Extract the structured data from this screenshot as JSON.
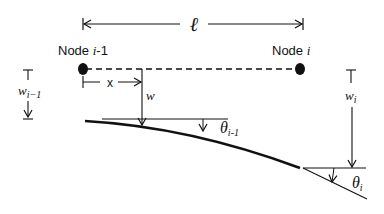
{
  "diagram": {
    "type": "beam-element-deflection",
    "colors": {
      "ink": "#111111",
      "background": "#ffffff"
    },
    "length_label": "ℓ",
    "nodes": [
      {
        "id": "left",
        "label_prefix": "Node ",
        "label_var": "i",
        "label_suffix": "-1"
      },
      {
        "id": "right",
        "label_prefix": "Node ",
        "label_var": "i",
        "label_suffix": ""
      }
    ],
    "position_label": "x",
    "deflection_label": "w",
    "left_deflection": {
      "symbol": "w",
      "subscript": "i−1"
    },
    "right_deflection": {
      "symbol": "w",
      "subscript": "i"
    },
    "left_slope": {
      "symbol": "θ",
      "subscript": "i-1"
    },
    "right_slope": {
      "symbol": "θ",
      "subscript": "i"
    }
  }
}
